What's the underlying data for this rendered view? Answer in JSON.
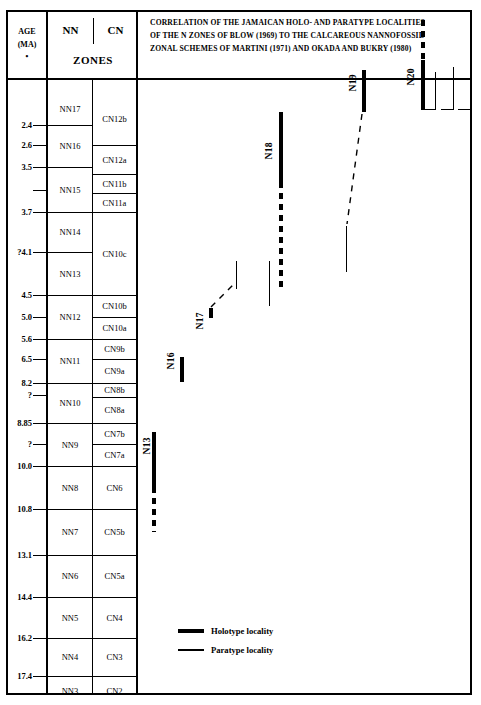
{
  "header": {
    "age_col": {
      "line1": "AGE",
      "line2": "(MA)",
      "marker": "•"
    },
    "nn_label": "NN",
    "cn_label": "CN",
    "zones_label": "ZONES",
    "title_lines": [
      "CORRELATION OF THE JAMAICAN HOLO- AND PARATYPE LOCALITIES",
      "OF THE N ZONES OF BLOW (1969) TO THE CALCAREOUS NANNOFOSSIL",
      "ZONAL SCHEMES OF MARTINI (1971) AND OKADA AND BUKRY (1980)"
    ]
  },
  "legend": {
    "items": [
      {
        "label": "Holotype locality",
        "style": "thick",
        "color": "#000000"
      },
      {
        "label": "Paratype locality",
        "style": "thin",
        "color": "#000000"
      }
    ]
  },
  "chart_data": {
    "type": "table",
    "title": "CORRELATION OF THE JAMAICAN HOLO- AND PARATYPE LOCALITIES OF THE N ZONES OF BLOW (1969) TO THE CALCAREOUS NANNOFOSSIL ZONAL SCHEMES OF MARTINI (1971) AND OKADA AND BUKRY (1980)",
    "ylabel": "AGE (MA)",
    "y_axis_direction": "increasing downward",
    "age_ticks": [
      {
        "label": "2.4",
        "y": 113
      },
      {
        "label": "2.6",
        "y": 133
      },
      {
        "label": "3.5",
        "y": 155
      },
      {
        "label": "",
        "y": 178
      },
      {
        "label": "3.7",
        "y": 200
      },
      {
        "label": "?4.1",
        "y": 240
      },
      {
        "label": "4.5",
        "y": 283
      },
      {
        "label": "5.0",
        "y": 305
      },
      {
        "label": "5.6",
        "y": 327
      },
      {
        "label": "6.5",
        "y": 347
      },
      {
        "label": "8.2",
        "y": 371
      },
      {
        "label": "?",
        "y": 383
      },
      {
        "label": "8.85",
        "y": 411
      },
      {
        "label": "?",
        "y": 432
      },
      {
        "label": "10.0",
        "y": 454
      },
      {
        "label": "10.8",
        "y": 497
      },
      {
        "label": "13.1",
        "y": 543
      },
      {
        "label": "14.4",
        "y": 585
      },
      {
        "label": "16.2",
        "y": 626
      },
      {
        "label": "17.4",
        "y": 664
      }
    ],
    "nn_zones": [
      {
        "label": "NN17",
        "top": 81,
        "bottom": 113
      },
      {
        "label": "NN16",
        "top": 113,
        "bottom": 155
      },
      {
        "label": "NN15",
        "top": 155,
        "bottom": 200
      },
      {
        "label": "NN14",
        "top": 200,
        "bottom": 240
      },
      {
        "label": "NN13",
        "top": 240,
        "bottom": 283
      },
      {
        "label": "NN12",
        "top": 283,
        "bottom": 327
      },
      {
        "label": "NN11",
        "top": 327,
        "bottom": 371
      },
      {
        "label": "NN10",
        "top": 371,
        "bottom": 411
      },
      {
        "label": "NN9",
        "top": 411,
        "bottom": 454
      },
      {
        "label": "NN8",
        "top": 454,
        "bottom": 497
      },
      {
        "label": "NN7",
        "top": 497,
        "bottom": 543
      },
      {
        "label": "NN6",
        "top": 543,
        "bottom": 585
      },
      {
        "label": "NN5",
        "top": 585,
        "bottom": 626
      },
      {
        "label": "NN4",
        "top": 626,
        "bottom": 664
      },
      {
        "label": "NN3",
        "top": 664,
        "bottom": 693
      }
    ],
    "cn_zones": [
      {
        "label": "CN12b",
        "top": 81,
        "bottom": 133
      },
      {
        "label": "CN12a",
        "top": 133,
        "bottom": 162
      },
      {
        "label": "CN11b",
        "top": 162,
        "bottom": 181
      },
      {
        "label": "CN11a",
        "top": 181,
        "bottom": 200
      },
      {
        "label": "CN10c",
        "top": 200,
        "bottom": 283
      },
      {
        "label": "CN10b",
        "top": 283,
        "bottom": 305
      },
      {
        "label": "CN10a",
        "top": 305,
        "bottom": 327
      },
      {
        "label": "CN9b",
        "top": 327,
        "bottom": 347
      },
      {
        "label": "CN9a",
        "top": 347,
        "bottom": 371
      },
      {
        "label": "CN8b",
        "top": 371,
        "bottom": 385
      },
      {
        "label": "CN8a",
        "top": 385,
        "bottom": 411
      },
      {
        "label": "CN7b",
        "top": 411,
        "bottom": 432
      },
      {
        "label": "CN7a",
        "top": 432,
        "bottom": 454
      },
      {
        "label": "CN6",
        "top": 454,
        "bottom": 497
      },
      {
        "label": "CN5b",
        "top": 497,
        "bottom": 543
      },
      {
        "label": "CN5a",
        "top": 543,
        "bottom": 585
      },
      {
        "label": "CN4",
        "top": 585,
        "bottom": 626
      },
      {
        "label": "CN3",
        "top": 626,
        "bottom": 664
      },
      {
        "label": "CN2",
        "top": 664,
        "bottom": 693
      }
    ],
    "n_zone_markers": [
      {
        "name": "N13",
        "label_x": 4,
        "label_y": 425,
        "holotype": {
          "x": 14,
          "top": 420,
          "height": 55
        },
        "holotype_dashed": {
          "x": 14,
          "top": 475,
          "height": 45
        },
        "paratypes": []
      },
      {
        "name": "N16",
        "label_x": 28,
        "label_y": 340,
        "holotype": {
          "x": 42,
          "top": 345,
          "height": 25
        },
        "paratypes": []
      },
      {
        "name": "N17",
        "label_x": 57,
        "label_y": 300,
        "holotype": {
          "x": 71,
          "top": 296,
          "height": 10
        },
        "paratypes": [
          {
            "x": 98,
            "top": 249,
            "height": 28
          }
        ],
        "connector": {
          "x1": 73,
          "y1": 295,
          "x2": 96,
          "y2": 272,
          "dashed": true
        }
      },
      {
        "name": "N18",
        "label_x": 126,
        "label_y": 130,
        "holotype": {
          "x": 141,
          "top": 100,
          "height": 70
        },
        "holotype_dashed": {
          "x": 141,
          "top": 170,
          "height": 110
        },
        "paratypes": [
          {
            "x": 131,
            "top": 249,
            "height": 45
          }
        ]
      },
      {
        "name": "N19",
        "label_x": 210,
        "label_y": 62,
        "holotype": {
          "x": 224,
          "top": 58,
          "height": 42
        },
        "paratypes": [
          {
            "x": 208,
            "top": 214,
            "height": 46
          }
        ],
        "connector": {
          "x1": 224,
          "y1": 102,
          "x2": 209,
          "y2": 212,
          "dashed": true
        }
      },
      {
        "name": "N20",
        "label_x": 268,
        "label_y": 56,
        "holotype": {
          "x": 283,
          "top": 48,
          "height": 50
        },
        "holotype_dashed": {
          "x": 283,
          "top": 8,
          "height": 40
        },
        "paratypes": [
          {
            "x": 297,
            "top": 60,
            "height": 38
          },
          {
            "x": 315,
            "top": 55,
            "height": 43
          },
          {
            "x": 332,
            "top": 42,
            "height": 56
          }
        ],
        "paratype_feet": [
          {
            "x": 286,
            "y": 97,
            "width": 11
          },
          {
            "x": 303,
            "y": 97,
            "width": 12
          },
          {
            "x": 320,
            "y": 97,
            "width": 12
          }
        ]
      }
    ]
  }
}
